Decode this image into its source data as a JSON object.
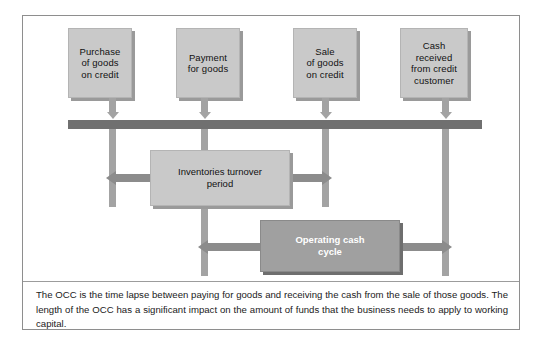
{
  "figure": {
    "colors": {
      "frame_border": "#8e8e8e",
      "box_fill": "#c9c9c9",
      "box_shadow": "#9a9a9a",
      "timeline_bar": "#707070",
      "connector": "#a3a3a3",
      "arrow": "#8c8c8c",
      "highlight_box_fill": "#a0a0a0",
      "highlight_box_text": "#ffffff",
      "text": "#111111",
      "background": "#ffffff"
    }
  },
  "events": [
    {
      "id": "purchase",
      "label": "Purchase\nof goods\non credit"
    },
    {
      "id": "payment",
      "label": "Payment\nfor goods"
    },
    {
      "id": "sale",
      "label": "Sale\nof goods\non credit"
    },
    {
      "id": "cash",
      "label": "Cash\nreceived\nfrom credit\ncustomer"
    }
  ],
  "periods": [
    {
      "id": "inventories-turnover-period",
      "label": "Inventories turnover\nperiod",
      "style": "light"
    },
    {
      "id": "operating-cash-cycle",
      "label": "Operating cash\ncycle",
      "style": "dark"
    }
  ],
  "caption": {
    "text": "The OCC is the time lapse between paying for goods and receiving the cash from the sale of those goods. The length of the OCC has a significant impact on the amount of funds that the business needs to apply to working capital."
  }
}
